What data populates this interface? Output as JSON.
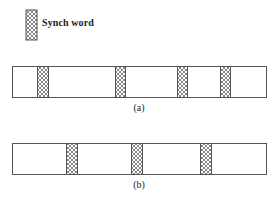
{
  "legend": {
    "label": "Synch word",
    "swatch": {
      "x": 26,
      "y": 10,
      "width": 11,
      "height": 30
    }
  },
  "colors": {
    "outline": "#555555",
    "hatch": "#666666",
    "background": "#ffffff"
  },
  "frames": [
    {
      "id": "a",
      "caption": "(a)",
      "x": 12,
      "y": 66,
      "width": 254,
      "height": 31,
      "caption_y": 102,
      "synch_words": [
        {
          "x": 37,
          "width": 11
        },
        {
          "x": 115,
          "width": 10
        },
        {
          "x": 177,
          "width": 10
        },
        {
          "x": 220,
          "width": 10
        }
      ]
    },
    {
      "id": "b",
      "caption": "(b)",
      "x": 12,
      "y": 143,
      "width": 254,
      "height": 31,
      "caption_y": 179,
      "synch_words": [
        {
          "x": 66,
          "width": 11
        },
        {
          "x": 131,
          "width": 11
        },
        {
          "x": 200,
          "width": 11
        }
      ]
    }
  ]
}
